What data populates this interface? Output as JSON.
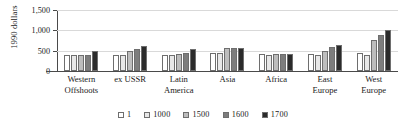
{
  "chart_data": {
    "type": "bar",
    "title": "",
    "xlabel": "",
    "ylabel": "1990 dollars",
    "ylim": [
      0,
      1500
    ],
    "yticks": [
      "0",
      "500",
      "1,000",
      "1,500"
    ],
    "ytick_values": [
      0,
      500,
      1000,
      1500
    ],
    "grid": true,
    "legend_position": "bottom",
    "categories": [
      "Western\nOffshoots",
      "ex USSR",
      "Latin\nAmerica",
      "Asia",
      "Africa",
      "East\nEurope",
      "West\nEurope"
    ],
    "series": [
      {
        "name": "1",
        "color": "#ffffff",
        "values": [
          400,
          400,
          400,
          450,
          430,
          410,
          450
        ]
      },
      {
        "name": "1000",
        "color": "#e8e8e8",
        "values": [
          400,
          400,
          400,
          450,
          400,
          400,
          400
        ]
      },
      {
        "name": "1500",
        "color": "#bdbdbd",
        "values": [
          400,
          500,
          410,
          570,
          410,
          500,
          770
        ]
      },
      {
        "name": "1600",
        "color": "#7d7d7d",
        "values": [
          400,
          550,
          440,
          570,
          420,
          600,
          890
        ]
      },
      {
        "name": "1700",
        "color": "#2b2b2b",
        "values": [
          490,
          610,
          530,
          570,
          420,
          650,
          1020
        ]
      }
    ]
  },
  "legend": {
    "items": [
      {
        "label": "1"
      },
      {
        "label": "1000"
      },
      {
        "label": "1500"
      },
      {
        "label": "1600"
      },
      {
        "label": "1700"
      }
    ]
  }
}
